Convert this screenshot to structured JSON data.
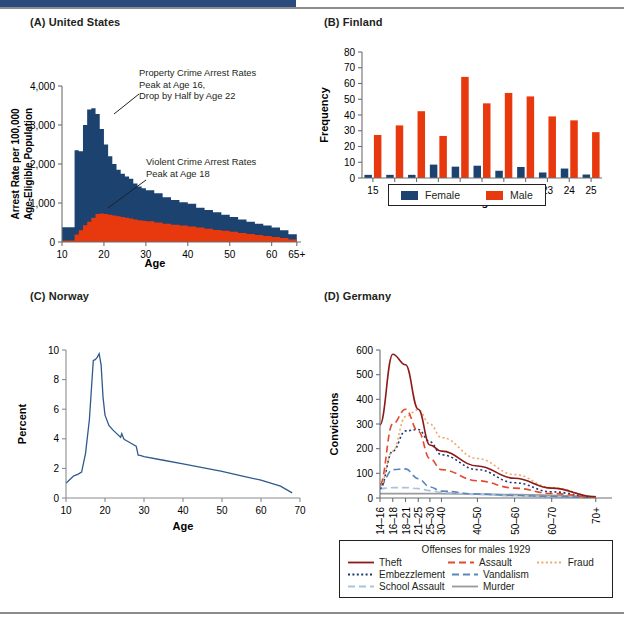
{
  "figure": {
    "panels": [
      {
        "key": "A",
        "title": "(A) United States"
      },
      {
        "key": "B",
        "title": "(B) Finland"
      },
      {
        "key": "C",
        "title": "(C) Norway"
      },
      {
        "key": "D",
        "title": "(D) Germany"
      }
    ]
  },
  "colors": {
    "navy": "#1c4270",
    "red": "#e8380d",
    "dark_red": "#8c1a18",
    "orange": "#f0a868",
    "blue_dark": "#1f3a6e",
    "blue_light": "#a8c4e0",
    "blue_mid": "#5b87bd",
    "gray": "#9a9a9a",
    "norway_line": "#2e5a8c",
    "header_bar": "#2b4a7d",
    "rule": "#8a8c8e"
  },
  "panelA": {
    "title": "(A) United States",
    "ylabel": "Arrest Rate per 100,000\nAge-Eligible Population",
    "ylabel_line1": "Arrest Rate per 100,000",
    "ylabel_line2": "Age-Eligible Population",
    "xlabel": "Age",
    "yticks": [
      "0",
      "1,000",
      "2,000",
      "3,000",
      "4,000"
    ],
    "xticks": [
      "10",
      "20",
      "30",
      "40",
      "50",
      "60",
      "65+"
    ],
    "annotations": [
      {
        "name": "property-crime-note",
        "text": "Property Crime Arrest Rates\nPeak at Age 16,\nDrop by Half by Age 22"
      },
      {
        "name": "violent-crime-note",
        "text": "Violent Crime Arrest Rates\nPeak at Age 18"
      }
    ]
  },
  "panelB": {
    "title": "(B) Finland",
    "ylabel": "Frequency",
    "xlabel": "Age",
    "yticks": [
      "0",
      "10",
      "20",
      "30",
      "40",
      "50",
      "60",
      "70",
      "80"
    ],
    "legend": [
      {
        "label": "Female",
        "color": "#1c4270"
      },
      {
        "label": "Male",
        "color": "#e8380d"
      }
    ]
  },
  "panelC": {
    "title": "(C) Norway",
    "ylabel": "Percent",
    "xlabel": "Age",
    "yticks": [
      "0",
      "2",
      "4",
      "6",
      "8",
      "10"
    ],
    "xticks": [
      "10",
      "20",
      "30",
      "40",
      "50",
      "60",
      "70"
    ]
  },
  "panelD": {
    "title": "(D) Germany",
    "ylabel": "Convictions",
    "yticks": [
      "0",
      "100",
      "200",
      "300",
      "400",
      "500",
      "600"
    ],
    "legend_title": "Offenses for males 1929",
    "legend": [
      {
        "label": "Theft",
        "color": "#8c1a18",
        "style": "solid"
      },
      {
        "label": "Assault",
        "color": "#e04a2f",
        "style": "dashed"
      },
      {
        "label": "Fraud",
        "color": "#f0a868",
        "style": "dotted"
      },
      {
        "label": "Embezzlement",
        "color": "#1f3a6e",
        "style": "dotted"
      },
      {
        "label": "Vandalism",
        "color": "#5b87bd",
        "style": "dashed"
      },
      {
        "label": "School Assault",
        "color": "#a8c4e0",
        "style": "dashed"
      },
      {
        "label": "Murder",
        "color": "#9a9a9a",
        "style": "solid"
      }
    ]
  },
  "chart_data": [
    {
      "type": "area",
      "panel": "A",
      "title": "(A) United States",
      "xlabel": "Age",
      "ylabel": "Arrest Rate per 100,000 Age-Eligible Population",
      "xlim": [
        10,
        67
      ],
      "ylim": [
        0,
        4000
      ],
      "grid": false,
      "legend_position": "none",
      "x": [
        10,
        11,
        12,
        13,
        14,
        15,
        16,
        17,
        18,
        19,
        20,
        21,
        22,
        23,
        24,
        25,
        26,
        27,
        28,
        29,
        30,
        32,
        34,
        36,
        38,
        40,
        42,
        44,
        46,
        48,
        50,
        52,
        54,
        56,
        58,
        60,
        62,
        64,
        66
      ],
      "series": [
        {
          "name": "Property Crime Arrest Rates",
          "color": "#1c4270",
          "values": [
            380,
            380,
            380,
            2350,
            2330,
            3000,
            3400,
            3430,
            3280,
            2900,
            2500,
            2200,
            2000,
            1850,
            1750,
            1680,
            1620,
            1500,
            1420,
            1380,
            1330,
            1250,
            1150,
            1080,
            1020,
            980,
            880,
            820,
            760,
            700,
            640,
            580,
            520,
            470,
            420,
            370,
            300,
            200,
            60
          ]
        },
        {
          "name": "Violent Crime Arrest Rates",
          "color": "#e8380d",
          "values": [
            40,
            40,
            40,
            190,
            300,
            430,
            520,
            620,
            720,
            730,
            720,
            700,
            680,
            660,
            640,
            620,
            600,
            580,
            560,
            545,
            530,
            500,
            470,
            440,
            420,
            400,
            370,
            340,
            310,
            290,
            260,
            230,
            205,
            180,
            155,
            130,
            100,
            65,
            20
          ]
        }
      ]
    },
    {
      "type": "bar",
      "panel": "B",
      "title": "(B) Finland",
      "xlabel": "Age",
      "ylabel": "Frequency",
      "categories": [
        "15",
        "16",
        "17",
        "18",
        "19",
        "20",
        "21",
        "22",
        "23",
        "24",
        "25"
      ],
      "ylim": [
        0,
        80
      ],
      "grid": false,
      "legend_position": "bottom",
      "series": [
        {
          "name": "Female",
          "color": "#1c4270",
          "values": [
            2,
            2,
            2,
            8.5,
            7.2,
            7.8,
            4.6,
            7.0,
            3.5,
            6.0,
            2.2
          ]
        },
        {
          "name": "Male",
          "color": "#e8380d",
          "values": [
            27.3,
            33.4,
            42.4,
            26.7,
            64.2,
            47.4,
            54.0,
            51.8,
            39.1,
            36.6,
            29.1
          ]
        }
      ]
    },
    {
      "type": "line",
      "panel": "C",
      "title": "(C) Norway",
      "xlabel": "Age",
      "ylabel": "Percent",
      "xlim": [
        10,
        70
      ],
      "ylim": [
        0,
        10
      ],
      "grid": false,
      "legend_position": "none",
      "series": [
        {
          "name": "Percent",
          "color": "#2e5a8c",
          "x": [
            10,
            11,
            12,
            13,
            14,
            15,
            16,
            17,
            17.5,
            18,
            18.5,
            19,
            19.5,
            20,
            21,
            22,
            23,
            24,
            24.3,
            24.8,
            25,
            26,
            27,
            28,
            28.5,
            29,
            30,
            35,
            40,
            45,
            50,
            55,
            60,
            65,
            68
          ],
          "values": [
            1.0,
            1.25,
            1.5,
            1.6,
            1.75,
            3.0,
            5.3,
            9.3,
            9.35,
            9.5,
            9.75,
            9.0,
            6.8,
            5.6,
            4.9,
            4.6,
            4.35,
            4.1,
            4.35,
            4.0,
            3.95,
            3.8,
            3.65,
            3.5,
            2.9,
            2.88,
            2.8,
            2.55,
            2.3,
            2.05,
            1.8,
            1.5,
            1.2,
            0.8,
            0.35
          ]
        }
      ]
    },
    {
      "type": "line",
      "panel": "D",
      "title": "(D) Germany",
      "xlabel": "",
      "ylabel": "Convictions",
      "categories": [
        "14–16",
        "16–18",
        "18–21",
        "21–25",
        "25–30",
        "30–40",
        "40–50",
        "50–60",
        "60–70",
        "70+"
      ],
      "ylim": [
        0,
        600
      ],
      "grid": false,
      "legend_position": "bottom",
      "legend_title": "Offenses for males 1929",
      "series": [
        {
          "name": "Theft",
          "color": "#8c1a18",
          "style": "solid",
          "values": [
            297,
            583,
            540,
            360,
            215,
            190,
            130,
            80,
            40,
            5
          ]
        },
        {
          "name": "Assault",
          "color": "#e04a2f",
          "style": "dashed",
          "values": [
            55,
            300,
            360,
            270,
            160,
            115,
            70,
            40,
            18,
            3
          ]
        },
        {
          "name": "Fraud",
          "color": "#f0a868",
          "style": "dotted",
          "values": [
            50,
            190,
            330,
            358,
            300,
            245,
            160,
            95,
            42,
            5
          ]
        },
        {
          "name": "Embezzlement",
          "color": "#1f3a6e",
          "style": "dotted",
          "values": [
            38,
            190,
            272,
            278,
            228,
            175,
            115,
            62,
            25,
            3
          ]
        },
        {
          "name": "Vandalism",
          "color": "#5b87bd",
          "style": "dashed",
          "values": [
            50,
            115,
            118,
            78,
            45,
            28,
            16,
            10,
            6,
            2
          ]
        },
        {
          "name": "School Assault",
          "color": "#a8c4e0",
          "style": "dashed",
          "values": [
            38,
            42,
            42,
            38,
            30,
            22,
            14,
            9,
            5,
            2
          ]
        },
        {
          "name": "Murder",
          "color": "#9a9a9a",
          "style": "solid",
          "values": [
            18,
            18,
            18,
            18,
            18,
            18,
            16,
            14,
            11,
            5
          ]
        }
      ]
    }
  ]
}
